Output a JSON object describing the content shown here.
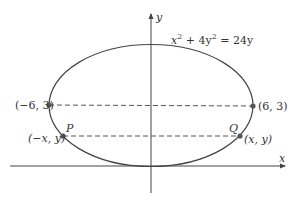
{
  "diagram": {
    "type": "ellipse-on-axes",
    "equation": {
      "prefix": "x",
      "exp1": "2",
      "middle": " + 4y",
      "exp2": "2",
      "suffix": " = 24y"
    },
    "axes": {
      "x_label": "x",
      "y_label": "y"
    },
    "points": [
      {
        "id": "left-vertex",
        "label": "(−6, 3)"
      },
      {
        "id": "right-vertex",
        "label": "(6, 3)"
      },
      {
        "id": "P",
        "name": "P",
        "label": "(−x, y)"
      },
      {
        "id": "Q",
        "name": "Q",
        "label": "(x, y)"
      }
    ],
    "colors": {
      "stroke": "#444444",
      "point": "#555555",
      "text": "#333333",
      "background": "#ffffff"
    }
  }
}
